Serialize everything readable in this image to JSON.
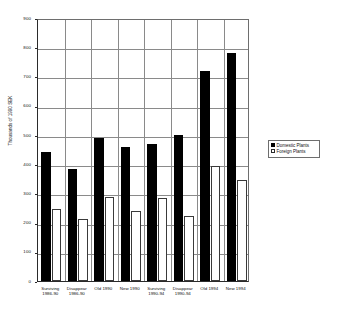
{
  "chart_data": {
    "type": "bar",
    "title": "",
    "xlabel": "",
    "ylabel": "Thousands of 1990 SEK",
    "ylim": [
      0,
      900
    ],
    "ytick_step": 100,
    "yticks": [
      900,
      800,
      700,
      600,
      500,
      400,
      300,
      200,
      100,
      0
    ],
    "grid": true,
    "legend_position": "right",
    "categories": [
      "Surviving 1986-90",
      "Disappear 1986-90",
      "Old 1990",
      "New 1990",
      "Surviving 1990-94",
      "Disappear 1990-94",
      "Old 1994",
      "New 1994"
    ],
    "category_lines": [
      [
        "Surviving",
        "1986-90"
      ],
      [
        "Disappear",
        "1986-90"
      ],
      [
        "Old 1990",
        ""
      ],
      [
        "New 1990",
        ""
      ],
      [
        "Surviving",
        "1990-94"
      ],
      [
        "Disappear",
        "1990-94"
      ],
      [
        "Old 1994",
        ""
      ],
      [
        "New 1994",
        ""
      ]
    ],
    "series": [
      {
        "name": "Domestic Plants",
        "color": "#000000",
        "values": [
          440,
          383,
          490,
          458,
          470,
          498,
          718,
          779
        ]
      },
      {
        "name": "Foreign Plants",
        "color": "#ffffff",
        "values": [
          247,
          212,
          287,
          240,
          283,
          223,
          392,
          347
        ]
      }
    ]
  },
  "legend": {
    "items": [
      {
        "label": "Domestic Plants"
      },
      {
        "label": "Foreign Plants"
      }
    ]
  }
}
